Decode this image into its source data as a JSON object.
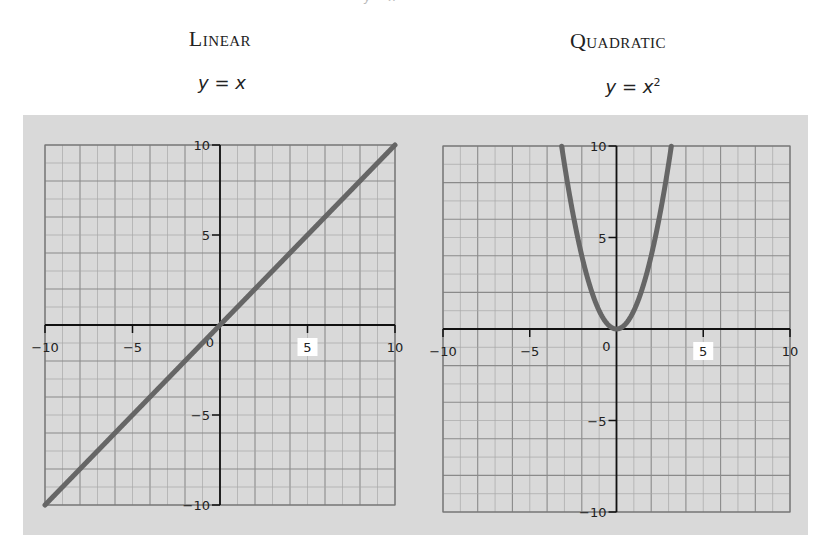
{
  "header_fragment": "y = x",
  "charts": [
    {
      "title": "Linear",
      "equation_prefix": "y = x",
      "equation_sup": ""
    },
    {
      "title": "Quadratic",
      "equation_prefix": "y = x",
      "equation_sup": "2"
    }
  ],
  "colors": {
    "background": "#d9d9d9",
    "grid_minor": "#a8a8a8",
    "grid_major": "#8a8a8a",
    "axis": "#111111",
    "curve": "#666666",
    "highlight": "#ffffff"
  },
  "chart_data": [
    {
      "type": "line",
      "title": "Linear",
      "subtitle": "y = x",
      "function": "y = x",
      "x": [
        -10,
        -5,
        0,
        5,
        10
      ],
      "y": [
        -10,
        -5,
        0,
        5,
        10
      ],
      "xlim": [
        -10,
        10
      ],
      "ylim": [
        -10,
        10
      ],
      "x_ticks": [
        -10,
        -5,
        0,
        5,
        10
      ],
      "y_ticks": [
        -10,
        -5,
        5,
        10
      ],
      "grid": true,
      "xlabel": "",
      "ylabel": "",
      "highlighted_tick": 5
    },
    {
      "type": "line",
      "title": "Quadratic",
      "subtitle": "y = x²",
      "function": "y = x^2",
      "x": [
        -3.16,
        -3,
        -2,
        -1,
        0,
        1,
        2,
        3,
        3.16
      ],
      "y": [
        10,
        9,
        4,
        1,
        0,
        1,
        4,
        9,
        10
      ],
      "xlim": [
        -10,
        10
      ],
      "ylim": [
        -10,
        10
      ],
      "x_ticks": [
        -10,
        -5,
        0,
        5,
        10
      ],
      "y_ticks": [
        -10,
        -5,
        5,
        10
      ],
      "grid": true,
      "xlabel": "",
      "ylabel": "",
      "highlighted_tick": 5
    }
  ]
}
